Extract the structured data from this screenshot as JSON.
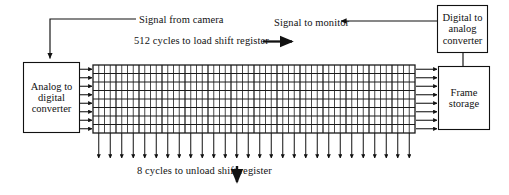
{
  "diagram": {
    "canvas": {
      "width": 509,
      "height": 195
    },
    "colors": {
      "background": "#ffffff",
      "stroke": "#111111",
      "grid_line": "#1a1a1a",
      "text": "#111111"
    },
    "boxes": [
      {
        "id": "analog-to-digital-converter",
        "label": "Analog to digital converter",
        "x": 23,
        "y": 62,
        "width": 57,
        "height": 71
      },
      {
        "id": "frame-storage",
        "label": "Frame storage",
        "x": 438,
        "y": 66,
        "width": 52,
        "height": 64
      },
      {
        "id": "digital-to-analog-converter",
        "label": "Digital to analog converter",
        "x": 437,
        "y": 5,
        "width": 51,
        "height": 48
      }
    ],
    "annotations": [
      {
        "id": "signal-from-camera",
        "text": "Signal from camera",
        "x": 139,
        "y": 14
      },
      {
        "id": "signal-to-monitor",
        "text": "Signal to monitor",
        "x": 274,
        "y": 17
      },
      {
        "id": "load-shift-register",
        "text": "512 cycles to load shift register",
        "x": 134,
        "y": 45
      },
      {
        "id": "unload-shift-register",
        "text": "8 cycles to unload shift register",
        "x": 137,
        "y": 170
      }
    ],
    "shift_register": {
      "id": "shift-register-grid",
      "x": 93,
      "y": 65,
      "width": 322,
      "height": 68,
      "rows": 8,
      "columns": 56,
      "input_arrows": 8,
      "output_arrows": 8,
      "unload_arrows": 28
    }
  }
}
